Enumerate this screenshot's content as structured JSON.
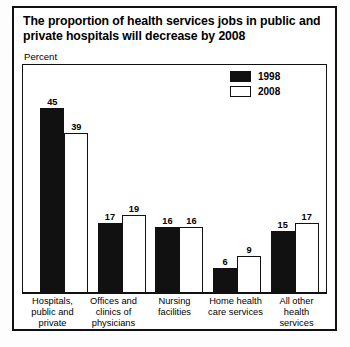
{
  "chart_data": {
    "type": "bar",
    "title": "The proportion of health services jobs in public and private hospitals will decrease by 2008",
    "ylabel": "Percent",
    "xlabel": "",
    "ylim": [
      0,
      50
    ],
    "grid": false,
    "legend_position": "top-right",
    "categories": [
      "Hospitals, public and private",
      "Offices and clinics of physicians",
      "Nursing facilities",
      "Home health care services",
      "All other health services"
    ],
    "series": [
      {
        "name": "1998",
        "values": [
          45,
          17,
          16,
          6,
          15
        ],
        "color": "#111111",
        "style": "filled"
      },
      {
        "name": "2008",
        "values": [
          39,
          19,
          16,
          9,
          17
        ],
        "color": "#ffffff",
        "style": "hollow"
      }
    ]
  },
  "legend": {
    "items": [
      {
        "label": "1998",
        "style": "filled"
      },
      {
        "label": "2008",
        "style": "hollow"
      }
    ]
  },
  "colors": {
    "bar_1998": "#111111",
    "bar_2008": "#ffffff",
    "outline": "#111111",
    "background": "#ffffff"
  }
}
